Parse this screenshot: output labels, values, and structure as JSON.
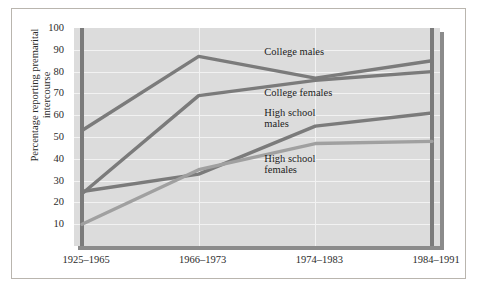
{
  "chart_data": {
    "type": "line",
    "title": "",
    "xlabel": "",
    "ylabel": "Percentage reporting premarital\nintercourse",
    "ylabel_line1": "Percentage reporting premarital",
    "ylabel_line2": "intercourse",
    "categories": [
      "1925–1965",
      "1966–1973",
      "1974–1983",
      "1984–1991"
    ],
    "ylim": [
      0,
      100
    ],
    "yticks": [
      100,
      90,
      80,
      70,
      60,
      50,
      40,
      30,
      20,
      10
    ],
    "grid": true,
    "legend_position": "inline-annotations",
    "series": [
      {
        "name": "College males",
        "values": [
          53,
          87,
          77,
          85
        ],
        "color": "#7b7b7b",
        "label": "College males"
      },
      {
        "name": "College females",
        "values": [
          24,
          69,
          76,
          80
        ],
        "color": "#7b7b7b",
        "label": "College females"
      },
      {
        "name": "High school males",
        "values": [
          25,
          33,
          55,
          61
        ],
        "color": "#7b7b7b",
        "label": "High school\nmales"
      },
      {
        "name": "High school females",
        "values": [
          10,
          35,
          47,
          48
        ],
        "color": "#a0a0a0",
        "label": "High school\nfemales"
      }
    ],
    "annotations": [
      {
        "text": "College males",
        "x_pct": 52,
        "y_value": 89
      },
      {
        "text": "College females",
        "x_pct": 52,
        "y_value": 70
      },
      {
        "text": "High school\nmales",
        "x_pct": 52,
        "y_value": 61
      },
      {
        "text": "High school\nfemales",
        "x_pct": 52,
        "y_value": 40
      }
    ],
    "colors": {
      "plot_background": "#dcdcdc",
      "gridlines": "#f2f2f2",
      "frame_border": "#b9b5ae",
      "plot_shadow": "#8b8b8b",
      "text": "#2b2b2b",
      "series_dark": "#7b7b7b",
      "series_light": "#a0a0a0"
    }
  }
}
